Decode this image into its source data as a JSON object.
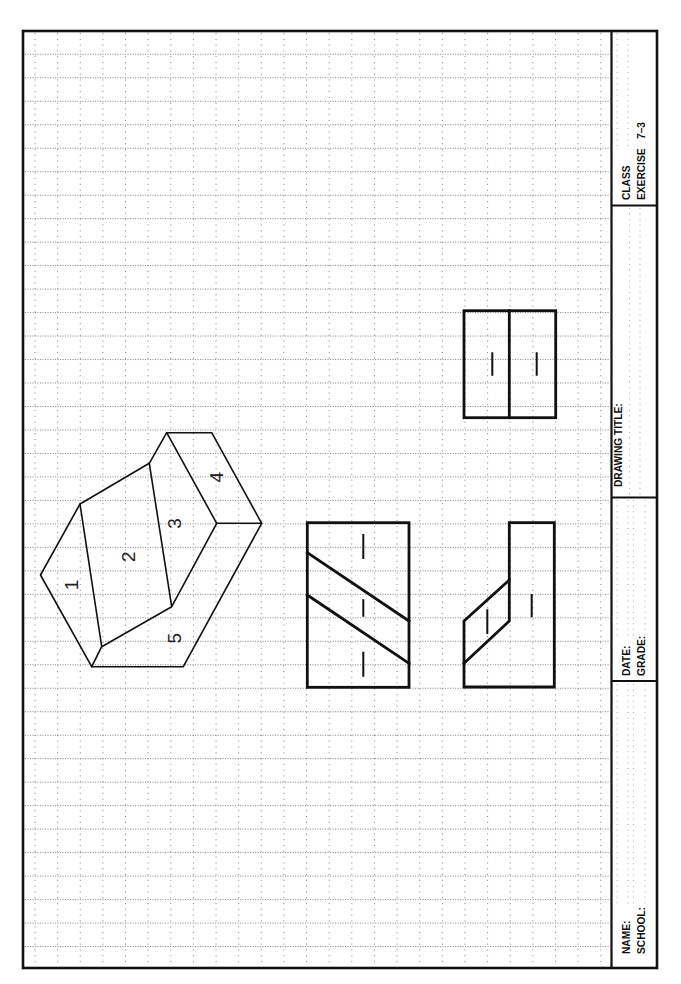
{
  "title_block": {
    "class_label": "CLASS",
    "exercise_label": "EXERCISE",
    "exercise_number": "7–3",
    "drawing_title_label": "DRAWING TITLE:",
    "date_label": "DATE:",
    "grade_label": "GRADE:",
    "name_label": "NAME:",
    "school_label": "SCHOOL:"
  },
  "isometric_view": {
    "face_labels": [
      "1",
      "2",
      "3",
      "4",
      "5"
    ]
  },
  "colors": {
    "paper": "#ffffff",
    "line": "#111111",
    "grid": "#8a8a8a"
  }
}
